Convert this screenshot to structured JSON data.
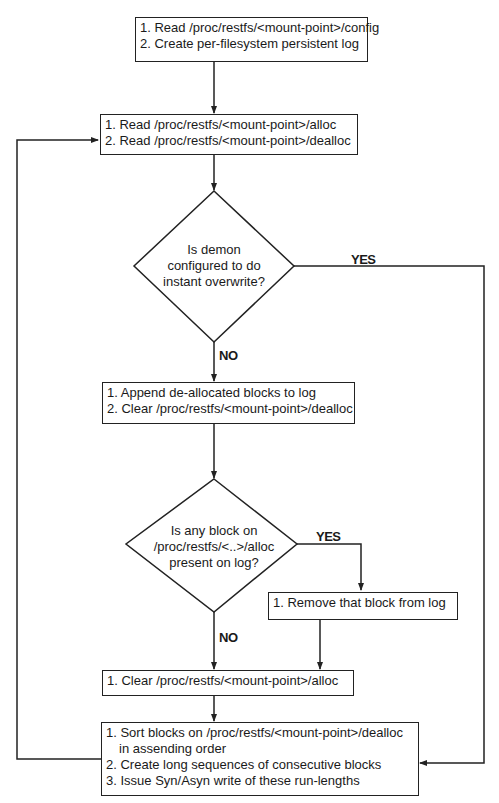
{
  "nodes": {
    "init": {
      "lines": [
        "1. Read /proc/restfs/<mount-point>/config",
        "2. Create per-filesystem persistent log"
      ]
    },
    "read": {
      "lines": [
        "1. Read /proc/restfs/<mount-point>/alloc",
        "2. Read /proc/restfs/<mount-point>/dealloc"
      ]
    },
    "decision_overwrite": {
      "lines": [
        "Is demon",
        "configured to do",
        "instant overwrite?"
      ]
    },
    "append": {
      "lines": [
        "1. Append de-allocated blocks to log",
        "2. Clear /proc/restfs/<mount-point>/dealloc"
      ]
    },
    "decision_block": {
      "lines": [
        "Is any block on",
        "/proc/restfs/<..>/alloc",
        "present on log?"
      ]
    },
    "remove": {
      "lines": [
        "1. Remove that block from log"
      ]
    },
    "clear_alloc": {
      "lines": [
        "1. Clear /proc/restfs/<mount-point>/alloc"
      ]
    },
    "sort": {
      "lines": [
        "1. Sort blocks on /proc/restfs/<mount-point>/dealloc",
        "in assending order",
        "2. Create long sequences of consecutive blocks",
        "3. Issue Syn/Asyn write of these run-lengths"
      ]
    }
  },
  "edge_labels": {
    "overwrite_yes": "YES",
    "overwrite_no": "NO",
    "block_yes": "YES",
    "block_no": "NO"
  }
}
